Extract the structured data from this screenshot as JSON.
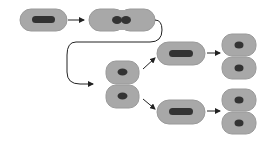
{
  "diagram": {
    "type": "bacterial-cell-division",
    "colors": {
      "cell_fill": "#a8a8a8",
      "cell_stroke": "#9a9a9a",
      "nucleoid": "#333333",
      "arrow": "#222222",
      "background": "#ffffff"
    },
    "stages": [
      {
        "id": "parent-cell",
        "label": ""
      },
      {
        "id": "dividing-cell",
        "label": ""
      },
      {
        "id": "daughter-pair",
        "label": ""
      },
      {
        "id": "elongated-cell-upper",
        "label": ""
      },
      {
        "id": "elongated-cell-lower",
        "label": ""
      },
      {
        "id": "daughter-pair-upper",
        "label": ""
      },
      {
        "id": "daughter-pair-lower",
        "label": ""
      }
    ]
  }
}
